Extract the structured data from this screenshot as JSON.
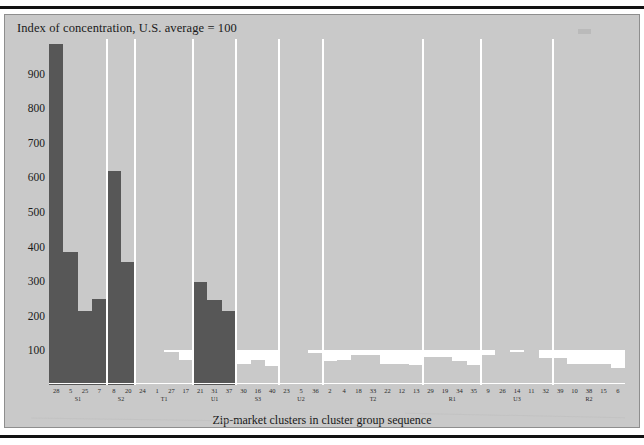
{
  "figure": {
    "title": "Index of concentration, U.S. average = 100",
    "x_caption": "Zip-market clusters in cluster group sequence",
    "panel_color": "#c9c9c9",
    "highlight_color": "#575757",
    "baseline_color": "#ffffff"
  },
  "yaxis": {
    "ticks": [
      "900",
      "800",
      "700",
      "600",
      "500",
      "400",
      "300",
      "200",
      "100"
    ],
    "values": [
      900,
      800,
      700,
      600,
      500,
      400,
      300,
      200,
      100
    ],
    "min": 0,
    "max": 1000
  },
  "chart_data": {
    "type": "bar",
    "title": "Index of concentration, U.S. average = 100",
    "xlabel": "Zip-market clusters in cluster group sequence",
    "ylabel": "Index of concentration, U.S. average = 100",
    "ylim": [
      0,
      1000
    ],
    "grid": false,
    "legend": "none",
    "reference_line": 100,
    "note": "Bars are zip-market clusters ordered within cluster groups; dark bars are the high-concentration clusters, light bars fall at or below the U.S. average of 100.",
    "groups": [
      {
        "name": "S1",
        "categories": [
          "28",
          "5",
          "25",
          "7"
        ],
        "values": [
          985,
          385,
          215,
          250
        ],
        "highlight": true
      },
      {
        "name": "S2",
        "categories": [
          "8",
          "20"
        ],
        "values": [
          620,
          355
        ],
        "highlight": true
      },
      {
        "name": "T1",
        "categories": [
          "24",
          "1",
          "27",
          "17"
        ],
        "values": [
          140,
          148,
          95,
          72
        ],
        "highlight": false
      },
      {
        "name": "U1",
        "categories": [
          "21",
          "31",
          "37"
        ],
        "values": [
          298,
          245,
          215
        ],
        "highlight": true
      },
      {
        "name": "S3",
        "categories": [
          "30",
          "16",
          "40"
        ],
        "values": [
          60,
          72,
          55
        ],
        "highlight": false
      },
      {
        "name": "U2",
        "categories": [
          "23",
          "5",
          "36"
        ],
        "values": [
          125,
          100,
          92
        ],
        "highlight": false
      },
      {
        "name": "T2",
        "categories": [
          "2",
          "4",
          "18",
          "33",
          "22",
          "12",
          "13"
        ],
        "values": [
          68,
          72,
          88,
          88,
          62,
          62,
          58
        ],
        "highlight": false
      },
      {
        "name": "R1",
        "categories": [
          "29",
          "19",
          "34",
          "35"
        ],
        "values": [
          80,
          80,
          68,
          58
        ],
        "highlight": false
      },
      {
        "name": "U3",
        "categories": [
          "9",
          "26",
          "14",
          "11",
          "32"
        ],
        "values": [
          88,
          105,
          95,
          115,
          78
        ],
        "highlight": false
      },
      {
        "name": "R2",
        "categories": [
          "39",
          "10",
          "38",
          "15",
          "6"
        ],
        "values": [
          78,
          62,
          62,
          60,
          48
        ],
        "highlight": false
      }
    ]
  }
}
